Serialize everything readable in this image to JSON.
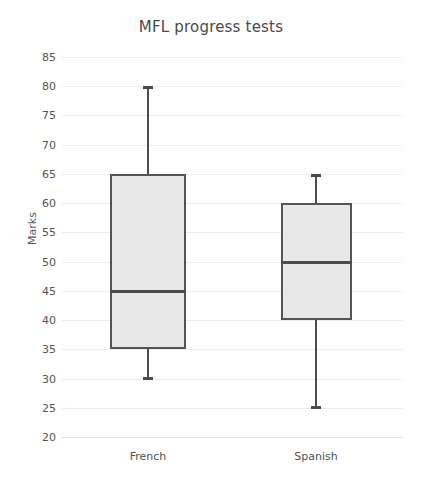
{
  "chart_data": {
    "type": "box",
    "title": "MFL progress tests",
    "xlabel": "",
    "ylabel": "Marks",
    "categories": [
      "French",
      "Spanish"
    ],
    "ylim": [
      20,
      85
    ],
    "ytick_step": 5,
    "yticks": [
      85,
      80,
      75,
      70,
      65,
      60,
      55,
      50,
      45,
      40,
      35,
      30,
      25,
      20
    ],
    "grid": true,
    "legend": null,
    "series": [
      {
        "name": "French",
        "min": 30,
        "q1": 35,
        "median": 45,
        "q3": 65,
        "max": 80
      },
      {
        "name": "Spanish",
        "min": 25,
        "q1": 40,
        "median": 50,
        "q3": 60,
        "max": 65
      }
    ],
    "colors": {
      "box_fill": "#e8e8e8",
      "box_border": "#555555",
      "median": "#4c4c4c",
      "whisker": "#4c4c4c",
      "gridline": "#ededed",
      "title_text": "#4a4a4a",
      "tick_text": "#555555",
      "background": "#ffffff"
    }
  }
}
